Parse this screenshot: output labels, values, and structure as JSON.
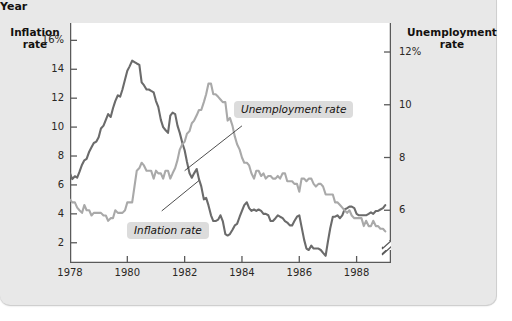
{
  "figure": {
    "left_axis_title": "Inflation\nrate",
    "left_axis_title_line1": "Inflation",
    "left_axis_title_line2": "rate",
    "right_axis_title_line1": "Unemployment",
    "right_axis_title_line2": "rate",
    "x_axis_title": "Year",
    "callouts": [
      {
        "name": "unemployment-rate-label",
        "text": "Unemployment rate"
      },
      {
        "name": "inflation-rate-label",
        "text": "Inflation rate"
      }
    ]
  },
  "colors": {
    "card_background": "#e8e8e8",
    "plot_background": "#ffffff",
    "inflation_line": "#6b6b6b",
    "unemployment_line": "#a9a9a9",
    "axis": "#5a5a5a",
    "text": "#14110f",
    "callout_background": "#dcdcdc"
  },
  "chart_data": {
    "type": "line",
    "title": "",
    "subtitle": "",
    "xlabel": "Year",
    "grid": false,
    "legend": "annotated-callouts",
    "x_axis": {
      "label": "Year",
      "ticks": [
        1978,
        1980,
        1982,
        1984,
        1986,
        1988
      ],
      "tick_labels": [
        "1978",
        "1980",
        "1982",
        "1984",
        "1986",
        "1988"
      ],
      "xlim": [
        1978,
        1989.2
      ]
    },
    "y_axis_left": {
      "label": "Inflation rate",
      "ticks": [
        2,
        4,
        6,
        8,
        10,
        12,
        14,
        16
      ],
      "tick_labels": [
        "2",
        "4",
        "6",
        "8",
        "10",
        "12",
        "14",
        "16%"
      ],
      "ylim": [
        0.6,
        17.2
      ],
      "unit": "percent"
    },
    "y_axis_right": {
      "label": "Unemployment rate",
      "ticks": [
        6,
        8,
        10,
        12
      ],
      "tick_labels": [
        "6",
        "8",
        "10",
        "12%"
      ],
      "ylim": [
        4.0,
        13.1
      ],
      "unit": "percent",
      "axis_break": true
    },
    "series": [
      {
        "name": "Inflation rate",
        "axis": "left",
        "color": "#6b6b6b",
        "x": [
          1978.0,
          1978.08,
          1978.17,
          1978.25,
          1978.33,
          1978.42,
          1978.5,
          1978.58,
          1978.67,
          1978.75,
          1978.83,
          1978.92,
          1979.0,
          1979.08,
          1979.17,
          1979.25,
          1979.33,
          1979.42,
          1979.5,
          1979.58,
          1979.67,
          1979.75,
          1979.83,
          1979.92,
          1980.0,
          1980.08,
          1980.17,
          1980.25,
          1980.33,
          1980.42,
          1980.5,
          1980.58,
          1980.67,
          1980.75,
          1980.83,
          1980.92,
          1981.0,
          1981.08,
          1981.17,
          1981.25,
          1981.33,
          1981.42,
          1981.5,
          1981.58,
          1981.67,
          1981.75,
          1981.83,
          1981.92,
          1982.0,
          1982.08,
          1982.17,
          1982.25,
          1982.33,
          1982.42,
          1982.5,
          1982.58,
          1982.67,
          1982.75,
          1982.83,
          1982.92,
          1983.0,
          1983.08,
          1983.17,
          1983.25,
          1983.33,
          1983.42,
          1983.5,
          1983.58,
          1983.67,
          1983.75,
          1983.83,
          1983.92,
          1984.0,
          1984.08,
          1984.17,
          1984.25,
          1984.33,
          1984.42,
          1984.5,
          1984.58,
          1984.67,
          1984.75,
          1984.83,
          1984.92,
          1985.0,
          1985.08,
          1985.17,
          1985.25,
          1985.33,
          1985.42,
          1985.5,
          1985.58,
          1985.67,
          1985.75,
          1985.83,
          1985.92,
          1986.0,
          1986.08,
          1986.17,
          1986.25,
          1986.33,
          1986.42,
          1986.5,
          1986.58,
          1986.67,
          1986.75,
          1986.83,
          1986.92,
          1987.0,
          1987.08,
          1987.17,
          1987.25,
          1987.33,
          1987.42,
          1987.5,
          1987.58,
          1987.67,
          1987.75,
          1987.83,
          1987.92,
          1988.0,
          1988.08,
          1988.17,
          1988.25,
          1988.33,
          1988.42,
          1988.5,
          1988.58,
          1988.67,
          1988.75,
          1988.83,
          1988.92,
          1989.0
        ],
        "y": [
          6.8,
          6.4,
          6.6,
          6.5,
          6.9,
          7.4,
          7.7,
          7.8,
          8.3,
          8.6,
          8.9,
          9.0,
          9.3,
          9.9,
          10.1,
          10.5,
          10.9,
          10.7,
          11.3,
          11.8,
          12.2,
          12.1,
          12.6,
          13.3,
          13.9,
          14.2,
          14.6,
          14.5,
          14.4,
          14.3,
          13.1,
          12.9,
          12.6,
          12.6,
          12.5,
          12.4,
          11.8,
          11.4,
          10.5,
          10.0,
          9.8,
          9.6,
          10.8,
          11.0,
          10.9,
          10.1,
          9.6,
          8.9,
          8.4,
          7.6,
          6.8,
          6.5,
          6.8,
          7.1,
          6.4,
          5.9,
          5.0,
          5.1,
          4.6,
          3.9,
          3.5,
          3.5,
          3.6,
          3.9,
          3.5,
          2.6,
          2.5,
          2.6,
          2.9,
          3.2,
          3.3,
          3.8,
          4.2,
          4.6,
          4.8,
          4.4,
          4.2,
          4.3,
          4.2,
          4.3,
          4.2,
          4.0,
          4.0,
          3.9,
          3.5,
          3.5,
          3.7,
          3.9,
          3.8,
          3.7,
          3.5,
          3.4,
          3.2,
          3.2,
          3.5,
          3.8,
          3.9,
          3.1,
          2.2,
          1.6,
          1.5,
          1.8,
          1.6,
          1.6,
          1.6,
          1.5,
          1.3,
          1.1,
          2.1,
          3.0,
          3.8,
          3.8,
          3.9,
          3.7,
          3.9,
          4.3,
          4.4,
          4.5,
          4.5,
          4.4,
          4.0,
          3.9,
          3.9,
          3.9,
          3.9,
          4.0,
          4.1,
          4.0,
          4.2,
          4.2,
          4.3,
          4.4,
          4.6
        ]
      },
      {
        "name": "Unemployment rate",
        "axis": "right",
        "color": "#a9a9a9",
        "x": [
          1978.0,
          1978.08,
          1978.17,
          1978.25,
          1978.33,
          1978.42,
          1978.5,
          1978.58,
          1978.67,
          1978.75,
          1978.83,
          1978.92,
          1979.0,
          1979.08,
          1979.17,
          1979.25,
          1979.33,
          1979.42,
          1979.5,
          1979.58,
          1979.67,
          1979.75,
          1979.83,
          1979.92,
          1980.0,
          1980.08,
          1980.17,
          1980.25,
          1980.33,
          1980.42,
          1980.5,
          1980.58,
          1980.67,
          1980.75,
          1980.83,
          1980.92,
          1981.0,
          1981.08,
          1981.17,
          1981.25,
          1981.33,
          1981.42,
          1981.5,
          1981.58,
          1981.67,
          1981.75,
          1981.83,
          1981.92,
          1982.0,
          1982.08,
          1982.17,
          1982.25,
          1982.33,
          1982.42,
          1982.5,
          1982.58,
          1982.67,
          1982.75,
          1982.83,
          1982.92,
          1983.0,
          1983.08,
          1983.17,
          1983.25,
          1983.33,
          1983.42,
          1983.5,
          1983.58,
          1983.67,
          1983.75,
          1983.83,
          1983.92,
          1984.0,
          1984.08,
          1984.17,
          1984.25,
          1984.33,
          1984.42,
          1984.5,
          1984.58,
          1984.67,
          1984.75,
          1984.83,
          1984.92,
          1985.0,
          1985.08,
          1985.17,
          1985.25,
          1985.33,
          1985.42,
          1985.5,
          1985.58,
          1985.67,
          1985.75,
          1985.83,
          1985.92,
          1986.0,
          1986.08,
          1986.17,
          1986.25,
          1986.33,
          1986.42,
          1986.5,
          1986.58,
          1986.67,
          1986.75,
          1986.83,
          1986.92,
          1987.0,
          1987.08,
          1987.17,
          1987.25,
          1987.33,
          1987.42,
          1987.5,
          1987.58,
          1987.67,
          1987.75,
          1987.83,
          1987.92,
          1988.0,
          1988.08,
          1988.17,
          1988.25,
          1988.33,
          1988.42,
          1988.5,
          1988.58,
          1988.67,
          1988.75,
          1988.83,
          1988.92,
          1989.0
        ],
        "y": [
          6.4,
          6.3,
          6.3,
          6.1,
          6.0,
          5.9,
          6.2,
          6.0,
          6.0,
          5.8,
          5.9,
          5.9,
          5.9,
          5.9,
          5.8,
          5.8,
          5.6,
          5.7,
          5.7,
          6.0,
          5.9,
          5.9,
          5.9,
          6.0,
          6.3,
          6.3,
          6.3,
          6.9,
          7.5,
          7.6,
          7.8,
          7.7,
          7.5,
          7.5,
          7.5,
          7.2,
          7.5,
          7.4,
          7.4,
          7.2,
          7.5,
          7.5,
          7.2,
          7.4,
          7.6,
          7.9,
          8.3,
          8.5,
          8.6,
          8.9,
          9.0,
          9.3,
          9.4,
          9.6,
          9.8,
          9.8,
          10.1,
          10.4,
          10.8,
          10.8,
          10.4,
          10.4,
          10.3,
          10.2,
          10.1,
          10.1,
          9.4,
          9.5,
          9.2,
          8.8,
          8.5,
          8.3,
          8.0,
          7.8,
          7.8,
          7.7,
          7.4,
          7.2,
          7.5,
          7.5,
          7.3,
          7.4,
          7.2,
          7.3,
          7.3,
          7.2,
          7.2,
          7.3,
          7.2,
          7.4,
          7.4,
          7.1,
          7.1,
          7.1,
          7.0,
          7.0,
          6.7,
          7.2,
          7.2,
          7.1,
          7.2,
          7.2,
          7.0,
          6.9,
          7.0,
          7.0,
          6.9,
          6.6,
          6.6,
          6.6,
          6.6,
          6.3,
          6.3,
          6.2,
          6.1,
          6.0,
          5.9,
          6.0,
          5.8,
          5.7,
          5.7,
          5.7,
          5.7,
          5.4,
          5.6,
          5.4,
          5.4,
          5.6,
          5.4,
          5.4,
          5.3,
          5.3,
          5.2
        ]
      }
    ],
    "annotations": [
      {
        "text": "Unemployment rate",
        "points_to": "unemployment-series"
      },
      {
        "text": "Inflation rate",
        "points_to": "inflation-series"
      }
    ]
  }
}
